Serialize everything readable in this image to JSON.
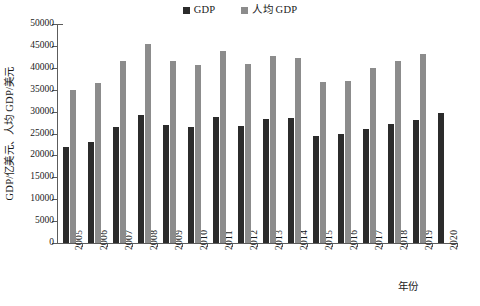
{
  "chart_data": {
    "type": "bar",
    "title": "",
    "xlabel": "年份",
    "ylabel": "GDP/亿美元、人均 GDP/美元",
    "categories": [
      "2005",
      "2006",
      "2007",
      "2008",
      "2009",
      "2010",
      "2011",
      "2012",
      "2013",
      "2014",
      "2015",
      "2016",
      "2017",
      "2018",
      "2019",
      "2020"
    ],
    "ylim": [
      0,
      50000
    ],
    "ytick_step": 5000,
    "yticks": [
      "0",
      "5000",
      "10000",
      "15000",
      "20000",
      "25000",
      "30000",
      "35000",
      "40000",
      "45000",
      "50000"
    ],
    "grid": false,
    "legend_position": "top-center",
    "series": [
      {
        "name": "GDP",
        "color": "#2b2b2b",
        "unit": "亿美元",
        "values": [
          22000,
          23100,
          26500,
          29300,
          26900,
          26500,
          28700,
          26800,
          28200,
          28500,
          24500,
          24900,
          26100,
          27100,
          28000,
          29600
        ]
      },
      {
        "name": "人均 GDP",
        "color": "#8c8c8c",
        "unit": "美元",
        "values": [
          34900,
          36600,
          41500,
          45400,
          41500,
          40700,
          43800,
          40800,
          42600,
          42300,
          36700,
          37000,
          39900,
          41500,
          43200,
          null
        ]
      }
    ]
  },
  "legend": {
    "items": [
      {
        "label": "GDP",
        "color": "#2b2b2b"
      },
      {
        "label": "人均 GDP",
        "color": "#8c8c8c"
      }
    ]
  },
  "axes": {
    "y_title": "GDP/亿美元、人均 GDP/美元",
    "x_title": "年份"
  }
}
